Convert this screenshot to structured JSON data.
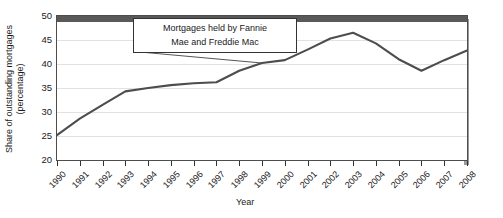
{
  "chart_data": {
    "type": "line",
    "title": "",
    "xlabel": "Year",
    "ylabel": "Share of outstanding mortgages (percentage)",
    "ylim": [
      20,
      50
    ],
    "yticks": [
      20,
      25,
      30,
      35,
      40,
      45,
      50
    ],
    "grid": true,
    "legend": "none",
    "categories": [
      "1990",
      "1991",
      "1992",
      "1993",
      "1994",
      "1995",
      "1996",
      "1997",
      "1998",
      "1999",
      "2000",
      "2001",
      "2002",
      "2003",
      "2004",
      "2005",
      "2006",
      "2007",
      "2008"
    ],
    "series": [
      {
        "name": "Mortgages held by Fannie Mae and Freddie Mac",
        "color": "#4d4d4d",
        "values": [
          25.2,
          28.6,
          31.5,
          34.3,
          35.0,
          35.6,
          36.0,
          36.2,
          38.6,
          40.2,
          40.8,
          43.0,
          45.3,
          46.5,
          44.3,
          41.0,
          38.6,
          40.8,
          42.8
        ]
      }
    ],
    "annotations": [
      {
        "text_line1": "Mortgages held by Fannie",
        "text_line2": "Mae and Freddie Mac",
        "points_to_year": "1999"
      }
    ]
  },
  "axis": {
    "y_title": "Share of outstanding mortgages (percentage)",
    "x_title": "Year"
  }
}
